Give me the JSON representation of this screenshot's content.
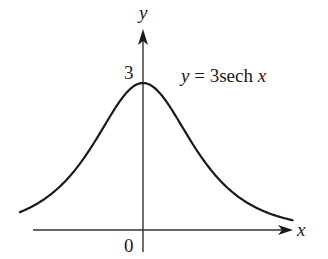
{
  "chart_data": {
    "type": "line",
    "title": "",
    "function": "y = 3sech x",
    "curve_label": "y = 3sech x",
    "xlabel": "x",
    "ylabel": "y",
    "x_tick_labels": [
      "0"
    ],
    "y_tick_labels": [
      "3"
    ],
    "x": [
      -2.8,
      -2.5,
      -2,
      -1.5,
      -1,
      -0.5,
      0,
      0.5,
      1,
      1.5,
      2,
      2.5,
      3,
      3.4
    ],
    "values": [
      0.367,
      0.492,
      0.798,
      1.273,
      1.944,
      2.663,
      3.0,
      2.663,
      1.944,
      1.273,
      0.798,
      0.492,
      0.298,
      0.2
    ],
    "xlim": [
      -3.1,
      3.5
    ],
    "ylim": [
      0,
      3.4
    ],
    "grid": false,
    "legend": "none",
    "annotations": [
      {
        "text": "y = 3sech x",
        "position": "upper right of peak"
      }
    ]
  },
  "labels": {
    "y_axis": "y",
    "x_axis": "x",
    "origin": "0",
    "peak": "3",
    "curve_y": "y",
    "curve_eq": " = 3sech ",
    "curve_x": "x"
  },
  "colors": {
    "curve": "#1a1a1a",
    "axes": "#333333",
    "background": "#ffffff"
  }
}
